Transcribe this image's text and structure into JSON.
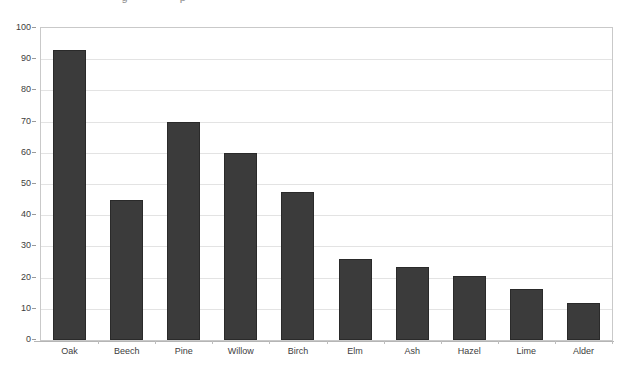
{
  "page": {
    "background_color": "#ffffff",
    "cropped_title_fragment": "                         g                p"
  },
  "chart_data": {
    "type": "bar",
    "title": "",
    "subtitle": "",
    "xlabel": "",
    "ylabel": "",
    "categories": [
      "Oak",
      "Beech",
      "Pine",
      "Willow",
      "Birch",
      "Elm",
      "Ash",
      "Hazel",
      "Lime",
      "Alder"
    ],
    "values": [
      93,
      45,
      70,
      60,
      47.5,
      26,
      23.5,
      20.5,
      16.5,
      12
    ],
    "series": [
      {
        "name": "",
        "values": [
          93,
          45,
          70,
          60,
          47.5,
          26,
          23.5,
          20.5,
          16.5,
          12
        ],
        "color": "#3b3b3b"
      }
    ],
    "ylim": [
      0,
      100
    ],
    "ytick_values": [
      0,
      10,
      20,
      30,
      40,
      50,
      60,
      70,
      80,
      90,
      100
    ],
    "ytick_labels": [
      "0",
      "10",
      "20",
      "30",
      "40",
      "50",
      "60",
      "70",
      "80",
      "90",
      "100"
    ],
    "grid": {
      "horizontal": true,
      "vertical": false,
      "color": "#e3e3e3"
    },
    "legend": {
      "visible": false,
      "position": "none",
      "entries": []
    },
    "bar_color": "#3b3b3b",
    "bar_border_color": "#2a2a2a",
    "plot_border_color": "#c9c9c9",
    "axis_text_color": "#3d3d3d"
  }
}
